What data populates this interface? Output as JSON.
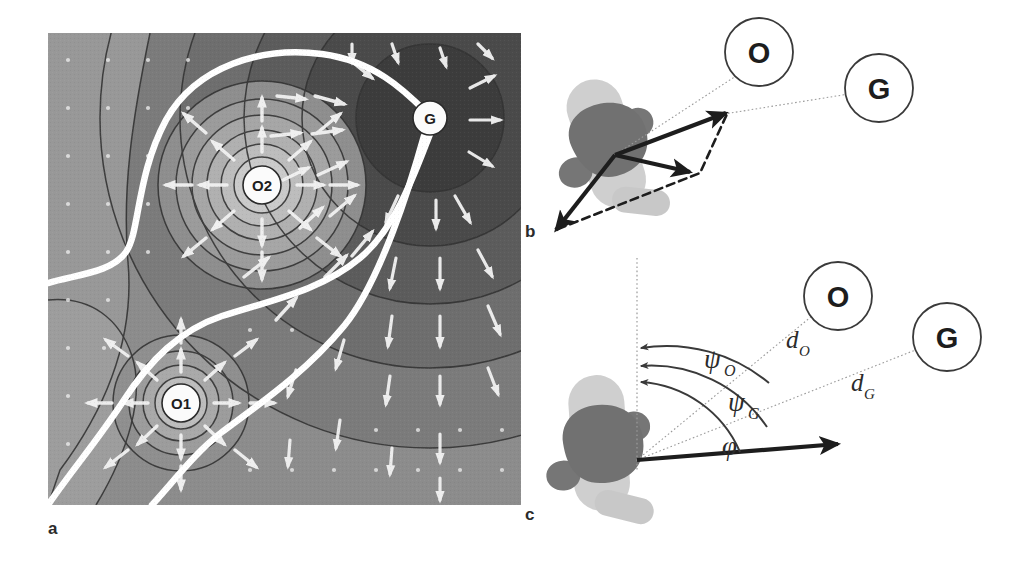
{
  "figure": {
    "panels": [
      {
        "id": "a",
        "label": "a",
        "caption_position": "below-left"
      },
      {
        "id": "b",
        "label": "b",
        "caption_position": "left"
      },
      {
        "id": "c",
        "label": "c",
        "caption_position": "below-left"
      }
    ]
  },
  "panel_a": {
    "label": "a",
    "description": "potential field heat map with contour lines, vector field arrows and two white planned paths",
    "nodes": [
      {
        "name": "obstacle-1",
        "label": "O1",
        "x": 181,
        "y": 403,
        "r": 19
      },
      {
        "name": "obstacle-2",
        "label": "O2",
        "x": 262,
        "y": 185,
        "r": 19
      },
      {
        "name": "goal",
        "label": "G",
        "x": 430,
        "y": 118,
        "r": 17
      }
    ],
    "colors": {
      "field_dark": "#3a3a3a",
      "field_mid": "#7f7f7f",
      "field_light": "#b4b4b4",
      "contour_line": "#3d3d3d",
      "path": "#ffffff",
      "node_fill": "#fdfdfd",
      "node_stroke": "#2a2a2a"
    },
    "map_bounds": {
      "x": 48,
      "y": 33,
      "width": 473,
      "height": 472
    }
  },
  "panel_b": {
    "label": "b",
    "nodes": [
      {
        "name": "obstacle-node",
        "label": "O",
        "x": 759,
        "y": 52,
        "r": 34
      },
      {
        "name": "goal-node",
        "label": "G",
        "x": 879,
        "y": 88,
        "r": 34
      }
    ],
    "vectors": [
      {
        "name": "attractive-vector",
        "style": "solid"
      },
      {
        "name": "resultant-vector",
        "style": "solid"
      },
      {
        "name": "repulsive-vector",
        "style": "solid"
      },
      {
        "name": "vector-sum-guide",
        "style": "dashed"
      }
    ],
    "colors": {
      "robot_body": "#c9c9c9",
      "robot_core": "#6a6a6a",
      "vector": "#1d1d1d",
      "dashed": "#1d1d1d",
      "leader_line": "#8a8a8a",
      "node_stroke": "#3a3a3a"
    }
  },
  "panel_c": {
    "label": "c",
    "nodes": [
      {
        "name": "obstacle-node",
        "label": "O",
        "x": 838,
        "y": 296,
        "r": 34
      },
      {
        "name": "goal-node",
        "label": "G",
        "x": 947,
        "y": 337,
        "r": 34
      }
    ],
    "angles": [
      {
        "name": "psi-obstacle",
        "label": "ψ",
        "subscript": "O"
      },
      {
        "name": "psi-goal",
        "label": "ψ",
        "subscript": "G"
      },
      {
        "name": "phi-heading",
        "label": "φ",
        "subscript": ""
      }
    ],
    "distances": [
      {
        "name": "distance-obstacle",
        "label": "d",
        "subscript": "O"
      },
      {
        "name": "distance-goal",
        "label": "d",
        "subscript": "G"
      }
    ],
    "colors": {
      "robot_body": "#c9c9c9",
      "robot_core": "#6a6a6a",
      "arc": "#3a3a3a",
      "dotted": "#9a9a9a",
      "heading_arrow": "#1d1d1d",
      "node_stroke": "#3a3a3a"
    }
  }
}
